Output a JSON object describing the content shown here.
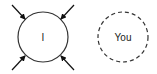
{
  "diagram": {
    "nodes": [
      {
        "id": "self",
        "label": "I",
        "border": "solid",
        "incoming_arrows": 4
      },
      {
        "id": "other",
        "label": "You",
        "border": "dashed",
        "incoming_arrows": 0
      }
    ],
    "colors": {
      "stroke": "#333333",
      "background": "#ffffff",
      "text": "#222222"
    }
  }
}
